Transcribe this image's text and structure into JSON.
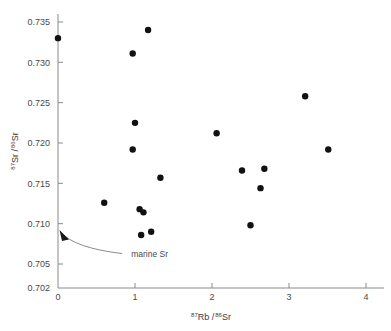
{
  "chart_data": {
    "type": "scatter",
    "title": "",
    "xlabel": "87Rb / 86Sr",
    "ylabel": "87Sr / 86Sr",
    "xlabel_parts": {
      "sup1": "87",
      "main1": "Rb /",
      "sup2": "86",
      "main2": "Sr"
    },
    "ylabel_parts": {
      "sup1": "87",
      "main1": "Sr /",
      "sup2": "86",
      "main2": "Sr"
    },
    "xlim": [
      0,
      4.35
    ],
    "ylim": [
      0.702,
      0.7365
    ],
    "xticks": [
      0,
      1,
      2,
      3,
      4
    ],
    "xticklabels": [
      "0",
      "1",
      "2",
      "3",
      "4"
    ],
    "yticks": [
      0.702,
      0.705,
      0.71,
      0.715,
      0.72,
      0.725,
      0.73,
      0.735
    ],
    "yticklabels": [
      "0.702",
      "0.705",
      "0.710",
      "0.715",
      "0.720",
      "0.725",
      "0.730",
      "0.735"
    ],
    "grid": false,
    "legend": "none",
    "marker": "filled-circle",
    "marker_color": "#111111",
    "marker_size_px": 3.2,
    "axis_color": "#8a8a8a",
    "points": [
      {
        "x": 0.0,
        "y": 0.733
      },
      {
        "x": 0.97,
        "y": 0.7311
      },
      {
        "x": 1.17,
        "y": 0.734
      },
      {
        "x": 1.0,
        "y": 0.7225
      },
      {
        "x": 0.97,
        "y": 0.7192
      },
      {
        "x": 1.33,
        "y": 0.7157
      },
      {
        "x": 0.6,
        "y": 0.7126
      },
      {
        "x": 1.06,
        "y": 0.7118
      },
      {
        "x": 1.11,
        "y": 0.7114
      },
      {
        "x": 1.08,
        "y": 0.7086
      },
      {
        "x": 1.21,
        "y": 0.709
      },
      {
        "x": 2.06,
        "y": 0.7212
      },
      {
        "x": 2.39,
        "y": 0.7166
      },
      {
        "x": 2.68,
        "y": 0.7168
      },
      {
        "x": 2.63,
        "y": 0.7144
      },
      {
        "x": 2.5,
        "y": 0.7098
      },
      {
        "x": 3.21,
        "y": 0.7258
      },
      {
        "x": 3.51,
        "y": 0.7192
      }
    ],
    "annotations": [
      {
        "text": "marine Sr",
        "target_x": 0.0,
        "target_y": 0.7092,
        "label_x": 0.95,
        "label_y": 0.7063,
        "style": "curved-arrow"
      }
    ]
  }
}
